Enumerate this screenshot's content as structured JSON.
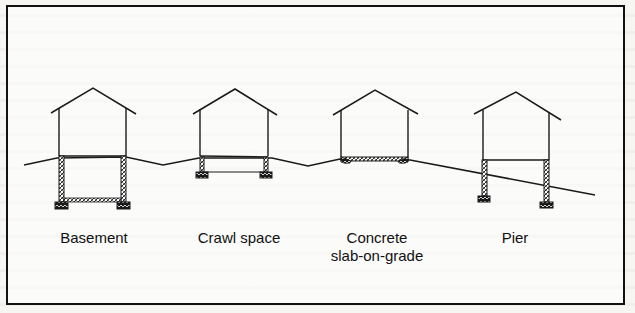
{
  "figure": {
    "type": "foundation-types-diagram",
    "colors": {
      "line": "#1a1a1a",
      "concrete_fill": "#d8d8d8",
      "footing_fill": "#1a1a1a",
      "background": "#f7f6f3"
    },
    "foundations": [
      {
        "id": "basement",
        "label": "Basement"
      },
      {
        "id": "crawl-space",
        "label": "Crawl space"
      },
      {
        "id": "slab",
        "label_line1": "Concrete",
        "label_line2": "slab-on-grade"
      },
      {
        "id": "pier",
        "label": "Pier"
      }
    ]
  }
}
